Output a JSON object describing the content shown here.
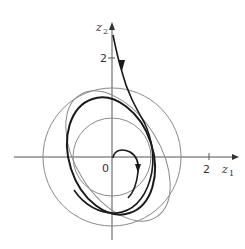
{
  "figure": {
    "type": "phase-portrait",
    "axes": {
      "x_label": "z",
      "x_label_sub": "1",
      "y_label": "z",
      "y_label_sub": "2",
      "origin_label": "0",
      "x_tick_label": "2",
      "y_tick_label": "2"
    },
    "curves": [
      {
        "name": "outer-circle",
        "kind": "circle",
        "radius_units": 1.4
      },
      {
        "name": "inner-circle",
        "kind": "circle",
        "radius_units": 0.8
      },
      {
        "name": "tilted-ellipse",
        "kind": "ellipse"
      },
      {
        "name": "limit-cycle",
        "kind": "closed-orbit"
      },
      {
        "name": "trajectory-from-above",
        "kind": "trajectory"
      },
      {
        "name": "trajectory-from-origin",
        "kind": "trajectory"
      }
    ],
    "colors": {
      "axis": "#555555",
      "thin_curves": "#8a8a8a",
      "thick_curves": "#1a1a1a"
    }
  }
}
